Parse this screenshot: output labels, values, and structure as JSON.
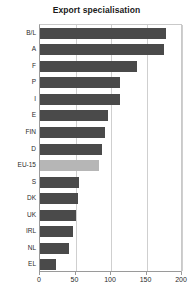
{
  "chart_data": {
    "type": "bar",
    "orientation": "horizontal",
    "title": "Export specialisation",
    "xlabel": "",
    "ylabel": "",
    "xlim": [
      0,
      200
    ],
    "xticks": [
      0,
      50,
      100,
      150,
      200
    ],
    "grid": true,
    "legend": null,
    "categories": [
      "B/L",
      "A",
      "F",
      "P",
      "I",
      "E",
      "FIN",
      "D",
      "EU-15",
      "S",
      "DK",
      "UK",
      "IRL",
      "NL",
      "EL"
    ],
    "values": [
      178,
      175,
      136,
      113,
      112,
      96,
      92,
      88,
      83,
      55,
      54,
      50,
      46,
      41,
      22
    ],
    "highlight_category": "EU-15",
    "colors": {
      "bar": "#4a4a4a",
      "bar_highlight": "#b6b6b6",
      "grid": "#cfcfcf",
      "axis": "#9a9a9a",
      "text": "#2a2a2a",
      "background": "#ffffff"
    }
  }
}
